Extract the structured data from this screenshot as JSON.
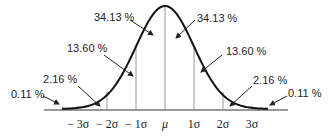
{
  "chart_data": {
    "type": "area",
    "x_ticks": [
      "−3σ",
      "−2σ",
      "−1σ",
      "μ",
      "1σ",
      "2σ",
      "3σ"
    ],
    "regions": [
      {
        "range": "< −3σ",
        "percent": "0.11 %"
      },
      {
        "range": "−3σ to −2σ",
        "percent": "2.16 %"
      },
      {
        "range": "−2σ to −1σ",
        "percent": "13.60 %"
      },
      {
        "range": "−1σ to μ",
        "percent": "34.13 %"
      },
      {
        "range": "μ to 1σ",
        "percent": "34.13 %"
      },
      {
        "range": "1σ to 2σ",
        "percent": "13.60 %"
      },
      {
        "range": "2σ to 3σ",
        "percent": "2.16 %"
      },
      {
        "range": "> 3σ",
        "percent": "0.11 %"
      }
    ]
  },
  "labels": {
    "left_34": "34.13 %",
    "left_13": "13.60 %",
    "left_2": "2.16 %",
    "left_0": "0.11 %",
    "right_34": "34.13 %",
    "right_13": "13.60 %",
    "right_2": "2.16 %",
    "right_0": "0.11 %"
  },
  "ticks": {
    "m3": "− 3σ",
    "m2": "− 2σ",
    "m1": "− 1σ",
    "mu": "μ",
    "p1": "1σ",
    "p2": "2σ",
    "p3": "3σ"
  }
}
